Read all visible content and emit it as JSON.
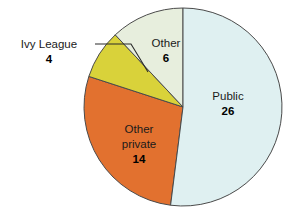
{
  "chart_data": {
    "type": "pie",
    "title": "",
    "categories": [
      "Public",
      "Other",
      "Ivy League",
      "Other private"
    ],
    "values": [
      26,
      6,
      4,
      14
    ],
    "total": 50,
    "legend": "none",
    "grid": false,
    "slices": [
      {
        "label": "Public",
        "value": 26,
        "value_text": "26",
        "color": "#dff0f1",
        "start_angle_deg": 0,
        "end_angle_deg": 187.2,
        "label_placement": "inside",
        "label_x": 228,
        "label_y": 100,
        "value_x": 228,
        "value_y": 115
      },
      {
        "label": "Other",
        "value": 6,
        "value_text": "6",
        "color": "#e7eedd",
        "start_angle_deg": 316.8,
        "end_angle_deg": 360,
        "label_placement": "inside",
        "label_x": 166,
        "label_y": 47,
        "value_x": 166,
        "value_y": 62
      },
      {
        "label": "Ivy League",
        "value": 4,
        "value_text": "4",
        "color": "#d9d23a",
        "start_angle_deg": 288,
        "end_angle_deg": 316.8,
        "label_placement": "callout",
        "label_x": 49,
        "label_y": 48,
        "value_x": 49,
        "value_y": 63
      },
      {
        "label_line1": "Other",
        "label_line2": "private",
        "label": "Other private",
        "value": 14,
        "value_text": "14",
        "color": "#e2712f",
        "start_angle_deg": 187.2,
        "end_angle_deg": 288,
        "label_placement": "inside",
        "label_x": 139,
        "label_y": 133,
        "label2_x": 139,
        "label2_y": 148,
        "value_x": 139,
        "value_y": 163
      }
    ],
    "geometry": {
      "center_x": 183,
      "center_y": 107,
      "radius": 99,
      "stroke_color": "#4a4a4a",
      "stroke_width": 1
    },
    "callout": {
      "line_color": "#2a2a2a",
      "h_start_x": 95,
      "h_start_y": 44,
      "h_end_x": 131,
      "h_end_y": 44,
      "tip_x": 148,
      "tip_y": 72
    },
    "background": "#ffffff"
  }
}
